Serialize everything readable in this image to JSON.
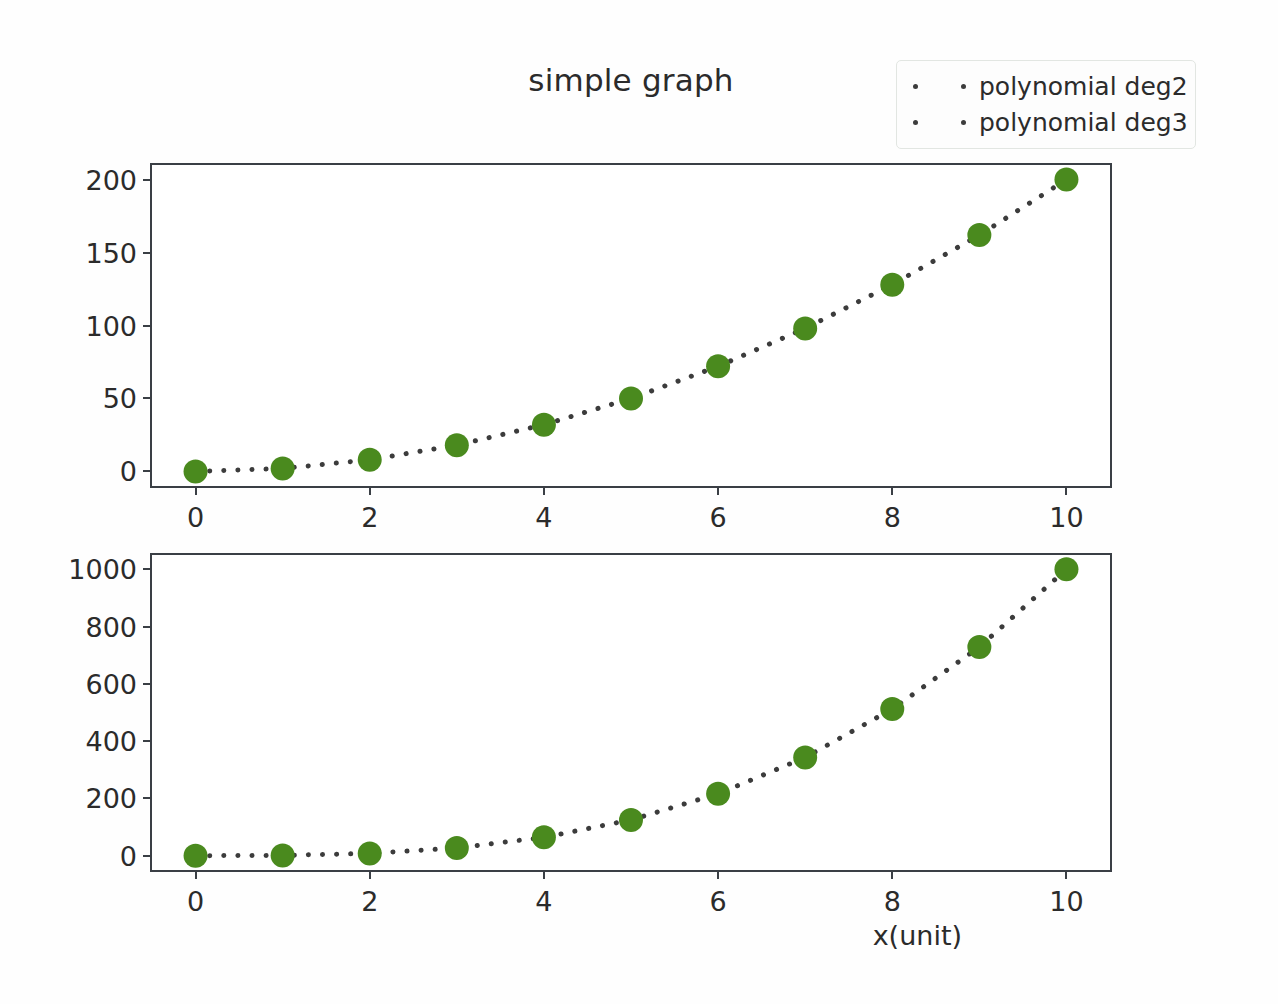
{
  "figure": {
    "title": "simple graph",
    "background_color": "#fefefe",
    "marker_color": "#4a8a1e",
    "line_color": "#3c3c3c",
    "spine_color": "#3a3f45",
    "text_color": "#2b2b2b"
  },
  "legend": {
    "position": "upper right",
    "entries": [
      {
        "label": "polynomial deg2",
        "marker": "circle-marker-icon",
        "linestyle": "dotted",
        "color": "#4a8a1e"
      },
      {
        "label": "polynomial deg3",
        "marker": "circle-marker-icon",
        "linestyle": "dotted",
        "color": "#4a8a1e"
      }
    ]
  },
  "axis_label": {
    "x": "x(unit)"
  },
  "chart_data": [
    {
      "type": "line",
      "subplot": "top",
      "title": "simple graph",
      "xlabel": "",
      "ylabel": "",
      "name": "polynomial deg2",
      "x": [
        0,
        1,
        2,
        3,
        4,
        5,
        6,
        7,
        8,
        9,
        10
      ],
      "values": [
        0,
        2,
        8,
        18,
        32,
        50,
        72,
        98,
        128,
        162,
        200
      ],
      "xlim": [
        -0.5,
        10.5
      ],
      "ylim": [
        -10,
        210
      ],
      "xticks": [
        0,
        2,
        4,
        6,
        8,
        10
      ],
      "yticks": [
        0,
        50,
        100,
        150,
        200
      ],
      "xticklabels": [
        "0",
        "2",
        "4",
        "6",
        "8",
        "10"
      ],
      "yticklabels": [
        "0",
        "50",
        "100",
        "150",
        "200"
      ],
      "grid": false,
      "linestyle": "dotted",
      "marker": "o",
      "color": "#4a8a1e",
      "legend": "upper right"
    },
    {
      "type": "line",
      "subplot": "bottom",
      "title": "",
      "xlabel": "x(unit)",
      "ylabel": "",
      "name": "polynomial deg3",
      "x": [
        0,
        1,
        2,
        3,
        4,
        5,
        6,
        7,
        8,
        9,
        10
      ],
      "values": [
        0,
        1,
        8,
        27,
        64,
        125,
        216,
        343,
        512,
        729,
        1000
      ],
      "xlim": [
        -0.5,
        10.5
      ],
      "ylim": [
        -50,
        1050
      ],
      "xticks": [
        0,
        2,
        4,
        6,
        8,
        10
      ],
      "yticks": [
        0,
        200,
        400,
        600,
        800,
        1000
      ],
      "xticklabels": [
        "0",
        "2",
        "4",
        "6",
        "8",
        "10"
      ],
      "yticklabels": [
        "0",
        "200",
        "400",
        "600",
        "800",
        "1000"
      ],
      "grid": false,
      "linestyle": "dotted",
      "marker": "o",
      "color": "#4a8a1e",
      "legend": null
    }
  ]
}
